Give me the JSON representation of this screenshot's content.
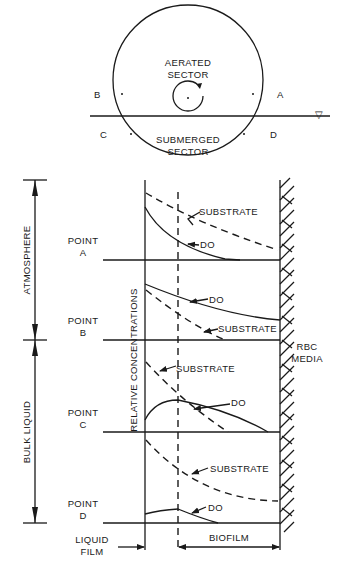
{
  "wheel": {
    "top_label_1": "AERATED",
    "top_label_2": "SECTOR",
    "bottom_label_1": "SUBMERGED",
    "bottom_label_2": "SECTOR",
    "points": [
      "A",
      "B",
      "C",
      "D"
    ],
    "water_surface_symbol": "▽"
  },
  "zones": {
    "atmosphere": "ATMOSPHERE",
    "bulk_liquid": "BULK LIQUID"
  },
  "profiles": [
    {
      "point_line1": "POINT",
      "point_line2": "A",
      "substrate": "SUBSTRATE",
      "do": "DO"
    },
    {
      "point_line1": "POINT",
      "point_line2": "B",
      "substrate": "SUBSTRATE",
      "do": "DO"
    },
    {
      "point_line1": "POINT",
      "point_line2": "C",
      "substrate": "SUBSTRATE",
      "do": "DO"
    },
    {
      "point_line1": "POINT",
      "point_line2": "D",
      "substrate": "SUBSTRATE",
      "do": "DO"
    }
  ],
  "axis": {
    "y_label": "RELATIVE CONCENTRATIONS"
  },
  "media": {
    "line1": "RBC",
    "line2": "MEDIA"
  },
  "bottom": {
    "liquid_film_1": "LIQUID",
    "liquid_film_2": "FILM",
    "biofilm": "BIOFILM"
  }
}
